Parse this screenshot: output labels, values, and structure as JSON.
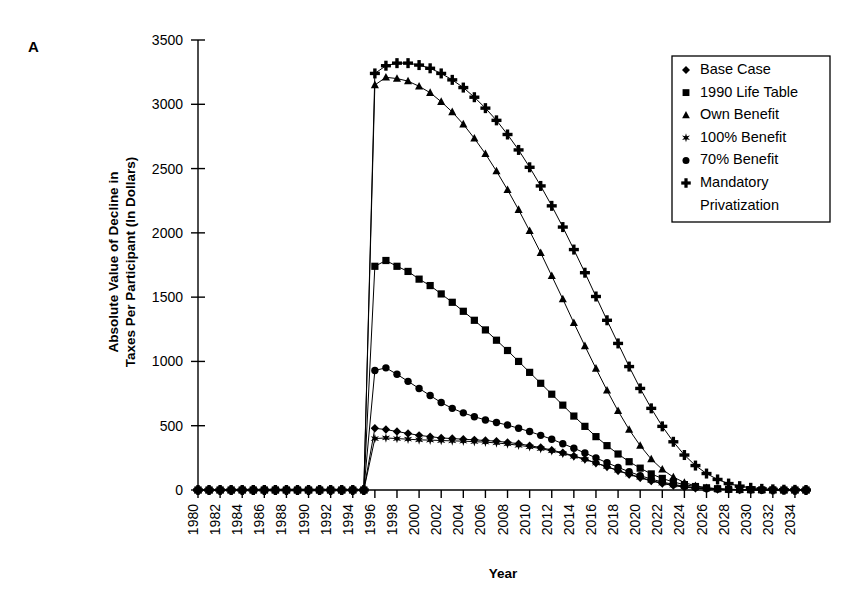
{
  "panel_label": "A",
  "axis_titles": {
    "y_line1": "Absolute Value of Decline in",
    "y_line2": "Taxes Per Participant (In Dollars)",
    "x": "Year"
  },
  "legend": {
    "items": [
      {
        "label": "Base Case",
        "marker": "diamond"
      },
      {
        "label": "1990 Life Table",
        "marker": "square"
      },
      {
        "label": "Own Benefit",
        "marker": "triangle"
      },
      {
        "label": "100% Benefit",
        "marker": "star"
      },
      {
        "label": "70% Benefit",
        "marker": "circle"
      },
      {
        "label": "Mandatory",
        "marker": "plus"
      },
      {
        "label": "Privatization",
        "marker": "none"
      }
    ]
  },
  "chart_data": {
    "type": "line",
    "title": "",
    "xlabel": "Year",
    "ylabel": "Absolute Value of Decline in Taxes Per Participant (In Dollars)",
    "ylim": [
      0,
      3500
    ],
    "yticks": [
      0,
      500,
      1000,
      1500,
      2000,
      2500,
      3000,
      3500
    ],
    "xlim": [
      1980,
      2035
    ],
    "xticks": [
      1980,
      1982,
      1984,
      1986,
      1988,
      1990,
      1992,
      1994,
      1996,
      1998,
      2000,
      2002,
      2004,
      2006,
      2008,
      2010,
      2012,
      2014,
      2016,
      2018,
      2020,
      2022,
      2024,
      2026,
      2028,
      2030,
      2032,
      2034
    ],
    "grid": false,
    "legend_position": "top-right",
    "x": [
      1980,
      1981,
      1982,
      1983,
      1984,
      1985,
      1986,
      1987,
      1988,
      1989,
      1990,
      1991,
      1992,
      1993,
      1994,
      1995,
      1996,
      1997,
      1998,
      1999,
      2000,
      2001,
      2002,
      2003,
      2004,
      2005,
      2006,
      2007,
      2008,
      2009,
      2010,
      2011,
      2012,
      2013,
      2014,
      2015,
      2016,
      2017,
      2018,
      2019,
      2020,
      2021,
      2022,
      2023,
      2024,
      2025,
      2026,
      2027,
      2028,
      2029,
      2030,
      2031,
      2032,
      2033,
      2034,
      2035
    ],
    "series": [
      {
        "name": "Base Case",
        "marker": "diamond",
        "values": [
          0,
          0,
          0,
          0,
          0,
          0,
          0,
          0,
          0,
          0,
          0,
          0,
          0,
          0,
          0,
          0,
          480,
          470,
          455,
          440,
          425,
          415,
          405,
          400,
          395,
          390,
          385,
          380,
          370,
          360,
          345,
          330,
          310,
          290,
          265,
          240,
          210,
          180,
          150,
          120,
          95,
          70,
          50,
          35,
          22,
          14,
          8,
          5,
          3,
          2,
          1,
          1,
          0,
          0,
          0,
          0
        ]
      },
      {
        "name": "1990 Life Table",
        "marker": "square",
        "values": [
          0,
          0,
          0,
          0,
          0,
          0,
          0,
          0,
          0,
          0,
          0,
          0,
          0,
          0,
          0,
          0,
          1740,
          1785,
          1740,
          1700,
          1640,
          1590,
          1525,
          1460,
          1390,
          1320,
          1245,
          1165,
          1085,
          1000,
          915,
          830,
          745,
          660,
          575,
          495,
          415,
          345,
          280,
          220,
          170,
          125,
          90,
          62,
          42,
          27,
          17,
          10,
          6,
          4,
          2,
          1,
          1,
          0,
          0,
          0
        ]
      },
      {
        "name": "Own Benefit",
        "marker": "triangle",
        "values": [
          0,
          0,
          0,
          0,
          0,
          0,
          0,
          0,
          0,
          0,
          0,
          0,
          0,
          0,
          0,
          0,
          3150,
          3210,
          3200,
          3180,
          3140,
          3090,
          3020,
          2940,
          2845,
          2735,
          2615,
          2480,
          2335,
          2180,
          2015,
          1845,
          1665,
          1485,
          1300,
          1120,
          945,
          775,
          615,
          470,
          345,
          240,
          160,
          100,
          58,
          32,
          17,
          9,
          5,
          3,
          2,
          1,
          0,
          0,
          0,
          0
        ]
      },
      {
        "name": "100% Benefit",
        "marker": "star",
        "values": [
          0,
          0,
          0,
          0,
          0,
          0,
          0,
          0,
          0,
          0,
          0,
          0,
          0,
          0,
          0,
          0,
          400,
          405,
          400,
          395,
          390,
          388,
          385,
          382,
          380,
          376,
          372,
          366,
          358,
          348,
          336,
          322,
          304,
          284,
          262,
          238,
          210,
          182,
          152,
          124,
          98,
          74,
          54,
          38,
          25,
          16,
          10,
          6,
          3,
          2,
          1,
          1,
          0,
          0,
          0,
          0
        ]
      },
      {
        "name": "70% Benefit",
        "marker": "circle",
        "values": [
          0,
          0,
          0,
          0,
          0,
          0,
          0,
          0,
          0,
          0,
          0,
          0,
          0,
          0,
          0,
          0,
          930,
          950,
          900,
          845,
          790,
          735,
          680,
          635,
          600,
          570,
          545,
          525,
          505,
          480,
          455,
          425,
          395,
          360,
          325,
          288,
          250,
          212,
          176,
          142,
          112,
          85,
          62,
          44,
          29,
          19,
          11,
          7,
          4,
          2,
          1,
          1,
          0,
          0,
          0,
          0
        ]
      },
      {
        "name": "Mandatory Privatization",
        "marker": "plus",
        "values": [
          0,
          0,
          0,
          0,
          0,
          0,
          0,
          0,
          0,
          0,
          0,
          0,
          0,
          0,
          0,
          0,
          3240,
          3300,
          3320,
          3320,
          3305,
          3280,
          3240,
          3190,
          3130,
          3055,
          2970,
          2875,
          2765,
          2645,
          2510,
          2365,
          2210,
          2045,
          1870,
          1690,
          1505,
          1320,
          1140,
          960,
          790,
          635,
          495,
          375,
          272,
          190,
          128,
          82,
          50,
          30,
          17,
          9,
          5,
          2,
          1,
          0
        ]
      }
    ]
  }
}
